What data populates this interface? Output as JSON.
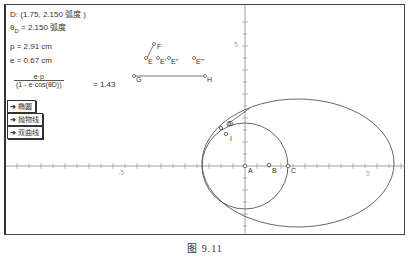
{
  "measurements": {
    "point_d": "D: (1.75, 2.150 弧度 )",
    "theta_prefix": "θ",
    "theta_sub": "D",
    "theta_value": " = 2.150 弧度",
    "p": "p = 2.91 cm",
    "e": "e = 0.67 cm",
    "fraction_numerator": "e·p",
    "fraction_denominator": "(1 - e·cos(θD))",
    "fraction_result": "= 1.43"
  },
  "buttons": [
    {
      "label": "椭圆"
    },
    {
      "label": "抛物线"
    },
    {
      "label": "双曲线"
    }
  ],
  "parameter_points": {
    "F": "F",
    "E": "E",
    "E1": "E'",
    "E2": "E\"",
    "E3": "E'\"",
    "G": "G",
    "H": "H"
  },
  "plot_points": {
    "A": "A",
    "B": "B",
    "C": "C",
    "D": "D",
    "I": "I"
  },
  "axis": {
    "x_tick_label_neg": "-5",
    "x_tick_label_pos": "5",
    "y_tick_label_pos": "5"
  },
  "caption": "图  9.11",
  "colors": {
    "line": "#555555",
    "axis": "#888888",
    "frame": "#333333"
  }
}
